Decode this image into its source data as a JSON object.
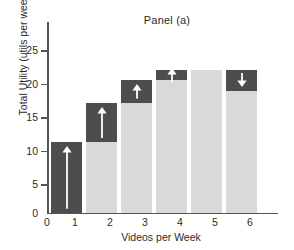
{
  "chart_data": {
    "type": "bar",
    "title": "Panel (a)",
    "xlabel": "Videos per Week",
    "ylabel": "Total Utility (utils per week)",
    "categories": [
      "1",
      "2",
      "3",
      "4",
      "5",
      "6"
    ],
    "x_tick_labels": [
      "0",
      "1",
      "2",
      "3",
      "4",
      "5",
      "6"
    ],
    "y_tick_labels": [
      "0",
      "5",
      "10",
      "15",
      "20",
      "25"
    ],
    "y_tick_values": [
      0,
      5,
      10,
      15,
      20,
      25
    ],
    "ylim": [
      0,
      27
    ],
    "grid": false,
    "legend": null,
    "values": [
      10.0,
      15.6,
      18.8,
      20.2,
      20.2,
      17.3
    ],
    "series": [
      {
        "name": "Total Utility",
        "values": [
          10.0,
          15.6,
          18.8,
          20.2,
          20.2,
          17.3
        ]
      }
    ],
    "bars": [
      {
        "category": "1",
        "total_utility": 10.0,
        "segment_bottom": 0.0,
        "segment_top": 10.0,
        "marginal_utility": 10.0,
        "highlight": "full-bar",
        "arrow": "up",
        "arrow_shaft": "long"
      },
      {
        "category": "2",
        "total_utility": 15.6,
        "segment_bottom": 10.0,
        "segment_top": 15.6,
        "marginal_utility": 5.6,
        "highlight": "top-segment",
        "arrow": "up",
        "arrow_shaft": "long"
      },
      {
        "category": "3",
        "total_utility": 18.8,
        "segment_bottom": 15.6,
        "segment_top": 18.8,
        "marginal_utility": 3.2,
        "highlight": "top-segment",
        "arrow": "up",
        "arrow_shaft": "medium"
      },
      {
        "category": "4",
        "total_utility": 20.2,
        "segment_bottom": 18.8,
        "segment_top": 20.2,
        "marginal_utility": 1.4,
        "highlight": "top-segment",
        "arrow": "up",
        "arrow_shaft": "short"
      },
      {
        "category": "5",
        "total_utility": 20.2,
        "segment_bottom": 20.2,
        "segment_top": 20.2,
        "marginal_utility": 0.0,
        "highlight": "none",
        "arrow": "none",
        "arrow_shaft": "none"
      },
      {
        "category": "6",
        "total_utility": 17.3,
        "segment_bottom": 17.3,
        "segment_top": 20.2,
        "marginal_utility": -2.9,
        "highlight": "top-segment",
        "arrow": "down",
        "arrow_shaft": "short"
      }
    ],
    "colors": {
      "bar_light": "#d9d9d9",
      "bar_dark": "#4d4d4d",
      "arrow": "#ffffff",
      "axis": "#555555",
      "text": "#2b2b2b",
      "background": "#ffffff"
    }
  }
}
